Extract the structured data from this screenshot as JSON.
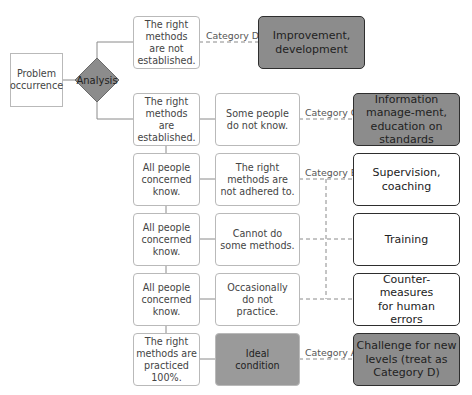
{
  "diagram": {
    "start": "Problem occurrence",
    "decision": "Analysis",
    "top_branch": {
      "condition": "The right methods are not established.",
      "category": "Category D",
      "action": "Improvement, development"
    },
    "rows": [
      {
        "left": "The right methods are established.",
        "middle": "Some people do not know.",
        "category": "Category C",
        "action": "Information manage-ment, education on standards"
      },
      {
        "left": "All people concerned know.",
        "middle": "The right methods are not adhered to.",
        "category": "Category B",
        "action": "Supervision, coaching"
      },
      {
        "left": "All people concerned know.",
        "middle": "Cannot do some methods.",
        "category": "",
        "action": "Training"
      },
      {
        "left": "All people concerned know.",
        "middle": "Occasionally do not practice.",
        "category": "",
        "action": "Counter-measures for human errors"
      },
      {
        "left": "The right methods are practiced 100%.",
        "middle": "Ideal condition",
        "category": "Category A",
        "action": "Challenge for new levels (treat as Category D)"
      }
    ]
  },
  "colors": {
    "dark_fill": "#8c8c8c",
    "border_light": "#b9b9b9",
    "border_dark": "#2e2e2e",
    "line": "#888888"
  }
}
